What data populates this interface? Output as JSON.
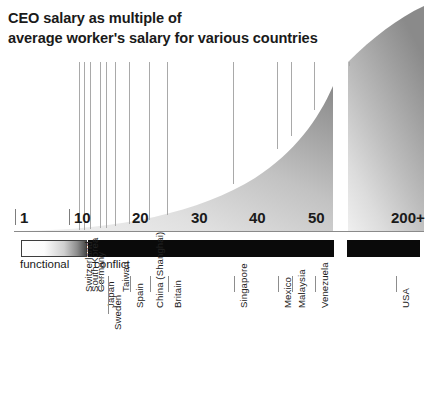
{
  "title": {
    "line1": "CEO salary as multiple of",
    "line2": "average worker's salary for various countries"
  },
  "axis": {
    "ticks": [
      {
        "label": "1",
        "value": 1,
        "x": 20
      },
      {
        "label": "10",
        "value": 10,
        "x": 74
      },
      {
        "label": "20",
        "value": 20,
        "x": 132
      },
      {
        "label": "30",
        "value": 30,
        "x": 191
      },
      {
        "label": "40",
        "value": 40,
        "x": 249
      },
      {
        "label": "50",
        "value": 50,
        "x": 308
      },
      {
        "label": "200+",
        "value": 200,
        "x": 391
      }
    ]
  },
  "legend": {
    "functional_label": "functional",
    "conflict_label": "conflict",
    "functional_gradient": [
      "#ffffff",
      "#4a4a4a"
    ],
    "conflict_color": "#0a0a0a"
  },
  "chart_data": {
    "type": "area",
    "title": "CEO salary as multiple of average worker's salary for various countries",
    "xlabel": "",
    "ylabel": "",
    "xlim": [
      1,
      200
    ],
    "grid": false,
    "legend_position": "below-axis",
    "categories": [
      "Switzerland",
      "South Korea",
      "Germany",
      "Japan",
      "Sweden",
      "Taiwan",
      "Spain",
      "China (Shanghai)",
      "Britain",
      "Singapore",
      "Mexico",
      "Malaysia",
      "Venezuela",
      "USA"
    ],
    "values": [
      11,
      11.5,
      12.5,
      13,
      13.5,
      15,
      17,
      21,
      24,
      37,
      45,
      47,
      51,
      200
    ],
    "series": [
      {
        "name": "CEO pay multiple",
        "points": [
          {
            "country": "Switzerland",
            "multiple": 11,
            "x": 79
          },
          {
            "country": "South Korea",
            "multiple": 11.5,
            "x": 84
          },
          {
            "country": "Germany",
            "multiple": 12.5,
            "x": 90
          },
          {
            "country": "Japan",
            "multiple": 13,
            "x": 101
          },
          {
            "country": "Sweden",
            "multiple": 13.5,
            "x": 107
          },
          {
            "country": "Taiwan",
            "multiple": 15,
            "x": 116
          },
          {
            "country": "Spain",
            "multiple": 17,
            "x": 129
          },
          {
            "country": "China (Shanghai)",
            "multiple": 21,
            "x": 150
          },
          {
            "country": "Britain",
            "multiple": 24,
            "x": 168
          },
          {
            "country": "Singapore",
            "multiple": 37,
            "x": 234
          },
          {
            "country": "Mexico",
            "multiple": 45,
            "x": 278
          },
          {
            "country": "Malaysia",
            "multiple": 47,
            "x": 292
          },
          {
            "country": "Venezuela",
            "multiple": 51,
            "x": 315
          },
          {
            "country": "USA",
            "multiple": 200,
            "x": 396
          }
        ]
      }
    ],
    "labels": [
      {
        "text": "Switzerland",
        "x": 79,
        "top": 292,
        "tick_top": 276,
        "tick_h": 0
      },
      {
        "text": "South Korea",
        "x": 85,
        "top": 292,
        "tick_top": 276,
        "tick_h": 0
      },
      {
        "text": "Germany",
        "x": 91,
        "top": 292,
        "tick_top": 276,
        "tick_h": 0
      },
      {
        "text": "Japan",
        "x": 101,
        "top": 292,
        "tick_top": 276,
        "tick_h": 16
      },
      {
        "text": "Sweden",
        "x": 108,
        "top": 292,
        "tick_top": 276,
        "tick_h": 38
      },
      {
        "text": "Taiwan",
        "x": 116,
        "top": 292,
        "tick_top": 276,
        "tick_h": 0
      },
      {
        "text": "Spain",
        "x": 130,
        "top": 292,
        "tick_top": 276,
        "tick_h": 16
      },
      {
        "text": "China (Shanghai)",
        "x": 150,
        "top": 292,
        "tick_top": 276,
        "tick_h": 16
      },
      {
        "text": "Britain",
        "x": 168,
        "top": 292,
        "tick_top": 276,
        "tick_h": 16
      },
      {
        "text": "Singapore",
        "x": 234,
        "top": 292,
        "tick_top": 276,
        "tick_h": 16
      },
      {
        "text": "Mexico",
        "x": 278,
        "top": 292,
        "tick_top": 276,
        "tick_h": 16
      },
      {
        "text": "Malaysia",
        "x": 292,
        "top": 292,
        "tick_top": 276,
        "tick_h": 16
      },
      {
        "text": "Venezuela",
        "x": 315,
        "top": 292,
        "tick_top": 276,
        "tick_h": 16
      },
      {
        "text": "USA",
        "x": 396,
        "top": 292,
        "tick_top": 276,
        "tick_h": 16
      }
    ],
    "vlines": [
      {
        "country": "Switzerland",
        "x": 79
      },
      {
        "country": "South Korea",
        "x": 84
      },
      {
        "country": "Germany",
        "x": 90
      },
      {
        "country": "Japan",
        "x": 100
      },
      {
        "country": "Sweden",
        "x": 106
      },
      {
        "country": "Taiwan",
        "x": 115
      },
      {
        "country": "Spain",
        "x": 129
      },
      {
        "country": "China (Shanghai)",
        "x": 149
      },
      {
        "country": "Britain",
        "x": 167
      },
      {
        "country": "Singapore",
        "x": 233
      },
      {
        "country": "Mexico",
        "x": 277
      },
      {
        "country": "Malaysia",
        "x": 291
      },
      {
        "country": "Venezuela",
        "x": 314
      },
      {
        "country": "USA",
        "x": 349
      }
    ]
  }
}
